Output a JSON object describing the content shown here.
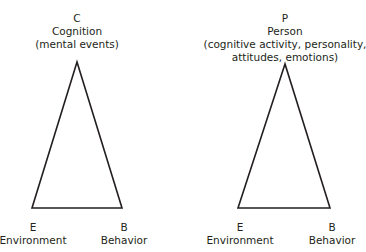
{
  "diagrams": [
    {
      "apex": {
        "letter": "C",
        "name": "Cognition",
        "detail": "(mental events)"
      },
      "left": {
        "letter": "E",
        "name": "Environment"
      },
      "right": {
        "letter": "B",
        "name": "Behavior"
      }
    },
    {
      "apex": {
        "letter": "P",
        "name": "Person",
        "detail_line1": "(cognitive activity, personality,",
        "detail_line2": "attitudes, emotions)"
      },
      "left": {
        "letter": "E",
        "name": "Environment"
      },
      "right": {
        "letter": "B",
        "name": "Behavior"
      }
    }
  ],
  "colors": {
    "stroke": "#231f20",
    "text": "#231f20"
  }
}
